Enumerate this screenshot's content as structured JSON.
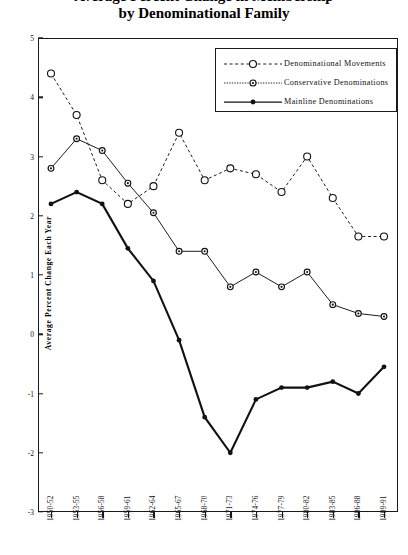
{
  "title": {
    "line1": "Average Percent Change in Membership",
    "line2": "by Denominational Family"
  },
  "axes": {
    "y_title": "Average Percent Change Each Year",
    "y_ticks": [
      "5",
      "4",
      "3",
      "2",
      "1",
      "0",
      "-1",
      "-2",
      "-3"
    ],
    "x_ticks": [
      "1950-52",
      "1953-55",
      "1956-58",
      "1959-61",
      "1962-64",
      "1965-67",
      "1968-70",
      "1971-73",
      "1974-76",
      "1977-79",
      "1980-82",
      "1983-85",
      "1986-88",
      "1989-91"
    ]
  },
  "legend": {
    "items": [
      {
        "label": "Denominational Movements",
        "style": "dashed-open-circle",
        "color": "#111111"
      },
      {
        "label": "Conservative Denominations",
        "style": "dotted-bullseye-circle",
        "color": "#111111"
      },
      {
        "label": "Mainline Denominations",
        "style": "solid-filled-circle",
        "color": "#111111"
      }
    ]
  },
  "chart_data": {
    "type": "line",
    "title": "Average Percent Change in Membership by Denominational Family",
    "xlabel": "",
    "ylabel": "Average Percent Change Each Year",
    "ylim": [
      -3,
      5
    ],
    "grid": false,
    "legend_position": "top-right",
    "categories": [
      "1950-52",
      "1953-55",
      "1956-58",
      "1959-61",
      "1962-64",
      "1965-67",
      "1968-70",
      "1971-73",
      "1974-76",
      "1977-79",
      "1980-82",
      "1983-85",
      "1986-88",
      "1989-91"
    ],
    "series": [
      {
        "name": "Denominational Movements",
        "marker": "open-circle",
        "line": "dashed",
        "values": [
          4.4,
          3.7,
          2.6,
          2.2,
          2.5,
          3.4,
          2.6,
          2.8,
          2.7,
          2.4,
          3.0,
          2.3,
          1.65,
          1.65
        ]
      },
      {
        "name": "Conservative Denominations",
        "marker": "bullseye-circle",
        "line": "solid-thin",
        "values": [
          2.8,
          3.3,
          3.1,
          2.55,
          2.05,
          1.4,
          1.4,
          0.8,
          1.05,
          0.8,
          1.05,
          0.5,
          0.35,
          0.3
        ]
      },
      {
        "name": "Mainline Denominations",
        "marker": "filled-circle",
        "line": "solid-thick",
        "values": [
          2.2,
          2.4,
          2.2,
          1.45,
          0.9,
          -0.1,
          -1.4,
          -2.0,
          -1.1,
          -0.9,
          -0.9,
          -0.8,
          -1.0,
          -0.55
        ]
      }
    ]
  }
}
